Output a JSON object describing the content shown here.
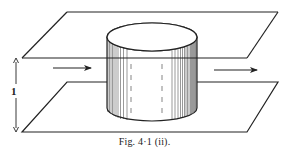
{
  "figure": {
    "caption": "Fig. 4·1 (ii).",
    "dimension_label": "1",
    "colors": {
      "ink": "#222222",
      "background": "#ffffff"
    },
    "elements": {
      "top_plane": "parallelogram",
      "bottom_plane": "parallelogram",
      "cylinder": "vertical cylinder spanning between planes",
      "flow_arrows": [
        "left-to-right arrow before cylinder",
        "left-to-right arrow after cylinder"
      ],
      "dimension": "vertical double arrow between planes labeled 1"
    }
  }
}
